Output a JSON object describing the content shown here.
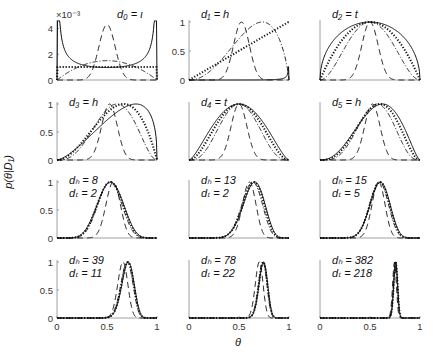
{
  "figure": {
    "ylabel": "p(θ|D₁)",
    "xlabel": "θ",
    "colors": {
      "curve": "#111111",
      "axis": "#888888",
      "text": "#333333"
    },
    "line_styles": [
      "solid",
      "dotted",
      "dashdot",
      "dashed"
    ]
  },
  "chart_data": [
    {
      "type": "line",
      "panel": 1,
      "title": "d0 = t",
      "label_lines": [
        "d₀ = ι"
      ],
      "ylim": [
        0,
        0.0045
      ],
      "yticks": [
        0,
        2,
        4
      ],
      "ytick_labels": [
        "0",
        "2",
        "4"
      ],
      "y_multiplier": "×10⁻³",
      "xlim": [
        0,
        1
      ],
      "xticks": [],
      "grid": false,
      "series": [
        {
          "name": "solid",
          "style": "solid",
          "beta": [
            0.3,
            0.3
          ],
          "scale": 0.0044,
          "note": "U-shaped, spikes at both ends"
        },
        {
          "name": "dotted",
          "style": "dotted",
          "beta": [
            1,
            1
          ],
          "scale": 0.001,
          "note": "flat at ~1e-3"
        },
        {
          "name": "dashdot",
          "style": "dashdot",
          "beta": [
            2,
            2
          ],
          "scale": 0.0015
        },
        {
          "name": "dashed",
          "style": "dashed",
          "beta": [
            20,
            20
          ],
          "scale": 0.0043
        }
      ]
    },
    {
      "type": "line",
      "panel": 2,
      "title": "d1 = h",
      "label_lines": [
        "d₁ = h"
      ],
      "ylim": [
        0,
        1
      ],
      "yticks": [
        0,
        0.5,
        1
      ],
      "ytick_labels": [
        "0",
        "0.5",
        "1"
      ],
      "xlim": [
        0,
        1
      ],
      "xticks": [],
      "grid": false,
      "series": [
        {
          "name": "solid",
          "style": "solid",
          "beta": [
            8,
            0.3
          ],
          "note": "spike at right end"
        },
        {
          "name": "dotted",
          "style": "dotted",
          "beta": [
            2,
            1
          ],
          "note": "linear increasing"
        },
        {
          "name": "dashdot",
          "style": "dashdot",
          "beta": [
            3.2,
            1.8
          ]
        },
        {
          "name": "dashed",
          "style": "dashed",
          "beta": [
            22,
            20
          ]
        }
      ]
    },
    {
      "type": "line",
      "panel": 3,
      "title": "d2 = t",
      "label_lines": [
        "d₂ = t"
      ],
      "ylim": [
        0,
        1
      ],
      "yticks": [],
      "xlim": [
        0,
        1
      ],
      "xticks": [],
      "grid": false,
      "series": [
        {
          "name": "solid",
          "style": "solid",
          "beta": [
            1.5,
            1.5
          ]
        },
        {
          "name": "dotted",
          "style": "dotted",
          "beta": [
            2,
            2
          ]
        },
        {
          "name": "dashdot",
          "style": "dashdot",
          "beta": [
            3,
            3
          ]
        },
        {
          "name": "dashed",
          "style": "dashed",
          "beta": [
            20,
            20
          ]
        }
      ]
    },
    {
      "type": "line",
      "panel": 4,
      "title": "d3 = h",
      "label_lines": [
        "d₃ = h"
      ],
      "ylim": [
        0,
        1
      ],
      "yticks": [
        0,
        0.5,
        1
      ],
      "ytick_labels": [
        "0",
        "0.5",
        "1"
      ],
      "xlim": [
        0,
        1
      ],
      "xticks": [],
      "grid": false,
      "series": [
        {
          "name": "solid",
          "style": "solid",
          "beta": [
            2.5,
            1.4
          ]
        },
        {
          "name": "dotted",
          "style": "dotted",
          "beta": [
            3,
            2
          ]
        },
        {
          "name": "dashdot",
          "style": "dashdot",
          "beta": [
            4,
            3
          ]
        },
        {
          "name": "dashed",
          "style": "dashed",
          "beta": [
            22,
            20
          ]
        }
      ]
    },
    {
      "type": "line",
      "panel": 5,
      "title": "d4 = t",
      "label_lines": [
        "d₄ = t"
      ],
      "ylim": [
        0,
        1
      ],
      "yticks": [],
      "xlim": [
        0,
        1
      ],
      "xticks": [],
      "grid": false,
      "series": [
        {
          "name": "solid",
          "style": "solid",
          "beta": [
            2.5,
            2.5
          ]
        },
        {
          "name": "dotted",
          "style": "dotted",
          "beta": [
            3,
            3
          ]
        },
        {
          "name": "dashdot",
          "style": "dashdot",
          "beta": [
            4,
            4
          ]
        },
        {
          "name": "dashed",
          "style": "dashed",
          "beta": [
            21,
            21
          ]
        }
      ]
    },
    {
      "type": "line",
      "panel": 6,
      "title": "d5 = h",
      "label_lines": [
        "d₅ = h"
      ],
      "ylim": [
        0,
        1
      ],
      "yticks": [],
      "xlim": [
        0,
        1
      ],
      "xticks": [],
      "grid": false,
      "series": [
        {
          "name": "solid",
          "style": "solid",
          "beta": [
            3.5,
            2.5
          ]
        },
        {
          "name": "dotted",
          "style": "dotted",
          "beta": [
            4,
            3
          ]
        },
        {
          "name": "dashdot",
          "style": "dashdot",
          "beta": [
            5,
            4
          ]
        },
        {
          "name": "dashed",
          "style": "dashed",
          "beta": [
            23,
            21
          ]
        }
      ]
    },
    {
      "type": "line",
      "panel": 7,
      "title": "dh = 8, dt = 2",
      "label_lines": [
        "dₕ = 8",
        "dₜ = 2"
      ],
      "ylim": [
        0,
        1
      ],
      "yticks": [
        0,
        0.5,
        1
      ],
      "ytick_labels": [
        "0",
        "0.5",
        "1"
      ],
      "xlim": [
        0,
        1
      ],
      "xticks": [],
      "grid": false,
      "series": [
        {
          "name": "solid",
          "style": "solid",
          "beta": [
            8.5,
            7.5
          ]
        },
        {
          "name": "dotted",
          "style": "dotted",
          "beta": [
            9,
            8
          ]
        },
        {
          "name": "dashdot",
          "style": "dashdot",
          "beta": [
            10,
            9
          ]
        },
        {
          "name": "dashed",
          "style": "dashed",
          "beta": [
            28,
            22
          ]
        }
      ]
    },
    {
      "type": "line",
      "panel": 8,
      "title": "dh = 13, dt = 2",
      "label_lines": [
        "dₕ = 13",
        "dₜ = 2"
      ],
      "ylim": [
        0,
        1
      ],
      "yticks": [],
      "xlim": [
        0,
        1
      ],
      "xticks": [],
      "grid": false,
      "series": [
        {
          "name": "solid",
          "style": "solid",
          "beta": [
            13.5,
            7.5
          ]
        },
        {
          "name": "dotted",
          "style": "dotted",
          "beta": [
            14,
            8
          ]
        },
        {
          "name": "dashdot",
          "style": "dashdot",
          "beta": [
            15,
            9
          ]
        },
        {
          "name": "dashed",
          "style": "dashed",
          "beta": [
            33,
            22
          ]
        }
      ]
    },
    {
      "type": "line",
      "panel": 9,
      "title": "dh = 15, dt = 5",
      "label_lines": [
        "dₕ = 15",
        "dₜ = 5"
      ],
      "ylim": [
        0,
        1
      ],
      "yticks": [],
      "xlim": [
        0,
        1
      ],
      "xticks": [],
      "grid": false,
      "series": [
        {
          "name": "solid",
          "style": "solid",
          "beta": [
            15.5,
            10.5
          ]
        },
        {
          "name": "dotted",
          "style": "dotted",
          "beta": [
            16,
            11
          ]
        },
        {
          "name": "dashdot",
          "style": "dashdot",
          "beta": [
            17,
            12
          ]
        },
        {
          "name": "dashed",
          "style": "dashed",
          "beta": [
            35,
            25
          ]
        }
      ]
    },
    {
      "type": "line",
      "panel": 10,
      "title": "dh = 39, dt = 11",
      "label_lines": [
        "dₕ = 39",
        "dₜ = 11"
      ],
      "ylim": [
        0,
        1
      ],
      "yticks": [
        0,
        0.5,
        1
      ],
      "ytick_labels": [
        "0",
        "0.5",
        "1"
      ],
      "xlim": [
        0,
        1
      ],
      "xticks": [
        0,
        0.5,
        1
      ],
      "xtick_labels": [
        "0",
        "0.5",
        "1"
      ],
      "grid": false,
      "series": [
        {
          "name": "solid",
          "style": "solid",
          "beta": [
            39.5,
            16.5
          ]
        },
        {
          "name": "dotted",
          "style": "dotted",
          "beta": [
            40,
            17
          ]
        },
        {
          "name": "dashdot",
          "style": "dashdot",
          "beta": [
            41,
            18
          ]
        },
        {
          "name": "dashed",
          "style": "dashed",
          "beta": [
            59,
            31
          ]
        }
      ]
    },
    {
      "type": "line",
      "panel": 11,
      "title": "dh = 78, dt = 22",
      "label_lines": [
        "dₕ = 78",
        "dₜ = 22"
      ],
      "ylim": [
        0,
        1
      ],
      "yticks": [],
      "xlim": [
        0,
        1
      ],
      "xticks": [
        0,
        0.5,
        1
      ],
      "xtick_labels": [
        "0",
        "0.5",
        "1"
      ],
      "grid": false,
      "series": [
        {
          "name": "solid",
          "style": "solid",
          "beta": [
            78.5,
            27.5
          ]
        },
        {
          "name": "dotted",
          "style": "dotted",
          "beta": [
            79,
            28
          ]
        },
        {
          "name": "dashdot",
          "style": "dashdot",
          "beta": [
            80,
            29
          ]
        },
        {
          "name": "dashed",
          "style": "dashed",
          "beta": [
            98,
            42
          ]
        }
      ]
    },
    {
      "type": "line",
      "panel": 12,
      "title": "dh = 382, dt = 218",
      "label_lines": [
        "dₕ = 382",
        "dₜ = 218"
      ],
      "ylim": [
        0,
        1
      ],
      "yticks": [],
      "xlim": [
        0,
        1
      ],
      "xticks": [
        0,
        0.5,
        1
      ],
      "xtick_labels": [
        "0",
        "0.5",
        "1"
      ],
      "grid": false,
      "series": [
        {
          "name": "solid",
          "style": "solid",
          "beta": [
            382.5,
            123.5
          ]
        },
        {
          "name": "dotted",
          "style": "dotted",
          "beta": [
            383,
            124
          ]
        },
        {
          "name": "dashdot",
          "style": "dashdot",
          "beta": [
            384,
            125
          ]
        },
        {
          "name": "dashed",
          "style": "dashed",
          "beta": [
            402,
            138
          ]
        }
      ]
    }
  ]
}
